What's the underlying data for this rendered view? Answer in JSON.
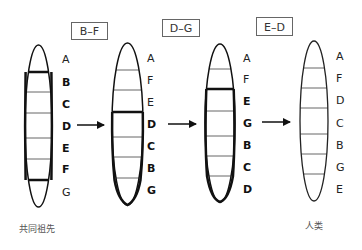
{
  "diagram": {
    "stages": [
      {
        "id": "ancestor",
        "caption": "共同祖先",
        "labels": [
          {
            "text": "A",
            "bold": false
          },
          {
            "text": "B",
            "bold": true
          },
          {
            "text": "C",
            "bold": true
          },
          {
            "text": "D",
            "bold": true
          },
          {
            "text": "E",
            "bold": true
          },
          {
            "text": "F",
            "bold": true
          },
          {
            "text": "G",
            "bold": false
          }
        ],
        "inverted_segment": "B–F"
      },
      {
        "id": "stage2",
        "labels": [
          {
            "text": "A",
            "bold": false
          },
          {
            "text": "F",
            "bold": false
          },
          {
            "text": "E",
            "bold": false
          },
          {
            "text": "D",
            "bold": true
          },
          {
            "text": "C",
            "bold": true
          },
          {
            "text": "B",
            "bold": true
          },
          {
            "text": "G",
            "bold": true
          }
        ],
        "inverted_segment": "D–G"
      },
      {
        "id": "stage3",
        "labels": [
          {
            "text": "A",
            "bold": false
          },
          {
            "text": "F",
            "bold": false
          },
          {
            "text": "E",
            "bold": true
          },
          {
            "text": "G",
            "bold": true
          },
          {
            "text": "B",
            "bold": true
          },
          {
            "text": "C",
            "bold": true
          },
          {
            "text": "D",
            "bold": true
          }
        ],
        "inverted_segment": "E–D"
      },
      {
        "id": "human",
        "caption": "人类",
        "labels": [
          {
            "text": "A",
            "bold": false
          },
          {
            "text": "F",
            "bold": false
          },
          {
            "text": "D",
            "bold": false
          },
          {
            "text": "C",
            "bold": false
          },
          {
            "text": "B",
            "bold": false
          },
          {
            "text": "G",
            "bold": false
          },
          {
            "text": "E",
            "bold": false
          }
        ]
      }
    ],
    "inversions": [
      "B–F",
      "D–G",
      "E–D"
    ],
    "captions": {
      "start": "共同祖先",
      "end": "人类"
    },
    "arrow_icon": "right-arrow"
  }
}
